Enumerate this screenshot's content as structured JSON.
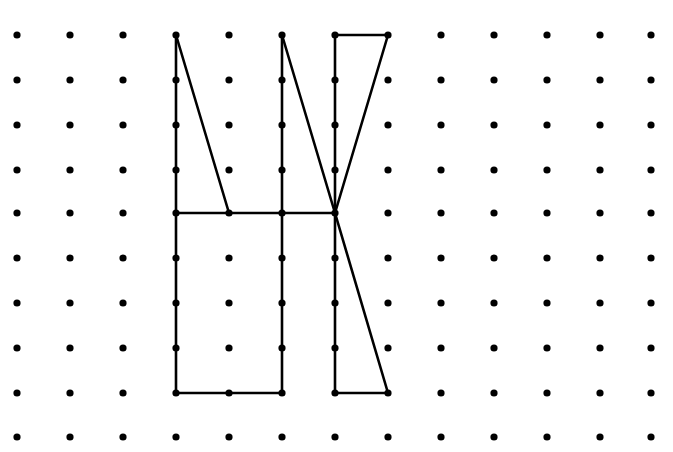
{
  "diagram": {
    "type": "dot-grid-figure",
    "background": "#ffffff",
    "ink": "#000000",
    "grid": {
      "columns": 13,
      "rows": 10,
      "x_positions": [
        17,
        70,
        123,
        176,
        229,
        282,
        335,
        388,
        441,
        494,
        547,
        600,
        651
      ],
      "y_positions": [
        35,
        80,
        125,
        170,
        213,
        258,
        303,
        348,
        393,
        437
      ],
      "dot_radius": 3.6
    },
    "segments": [
      {
        "from": [
          3,
          0
        ],
        "to": [
          3,
          8
        ]
      },
      {
        "from": [
          3,
          0
        ],
        "to": [
          4,
          4
        ]
      },
      {
        "from": [
          3,
          4
        ],
        "to": [
          6,
          4
        ]
      },
      {
        "from": [
          5,
          0
        ],
        "to": [
          5,
          8
        ]
      },
      {
        "from": [
          3,
          8
        ],
        "to": [
          5,
          8
        ]
      },
      {
        "from": [
          5,
          0
        ],
        "to": [
          6,
          4
        ]
      },
      {
        "from": [
          6,
          0
        ],
        "to": [
          6,
          8
        ]
      },
      {
        "from": [
          6,
          0
        ],
        "to": [
          7,
          0
        ]
      },
      {
        "from": [
          7,
          0
        ],
        "to": [
          6,
          4
        ]
      },
      {
        "from": [
          6,
          4
        ],
        "to": [
          7,
          8
        ]
      },
      {
        "from": [
          6,
          8
        ],
        "to": [
          7,
          8
        ]
      }
    ],
    "line_width": 2.6
  }
}
